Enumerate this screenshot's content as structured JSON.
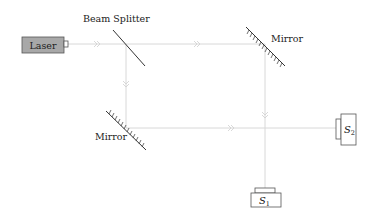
{
  "diagram": {
    "type": "Mach-Zehnder interferometer",
    "laser": {
      "label": "Laser",
      "fill": "#a8a8a8"
    },
    "beam_splitter": {
      "label": "Beam Splitter"
    },
    "mirrors": [
      {
        "label": "Mirror",
        "position": "top-right"
      },
      {
        "label": "Mirror",
        "position": "bottom-left"
      }
    ],
    "detectors": [
      {
        "label": "S",
        "sub": "2",
        "position": "right"
      },
      {
        "label": "S",
        "sub": "1",
        "position": "bottom"
      }
    ],
    "beam_color": "#dcdcdc",
    "arrow_marker": "»"
  }
}
